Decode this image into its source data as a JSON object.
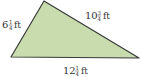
{
  "diagram": {
    "shape": "triangle",
    "fill_color": "#c9dcae",
    "stroke_color": "#3a3a3a",
    "vertices": {
      "top": [
        44,
        1
      ],
      "left": [
        11,
        57
      ],
      "right": [
        139,
        58
      ]
    },
    "labels": {
      "left_side": {
        "whole": "6",
        "num": "1",
        "den": "4",
        "unit": "ft"
      },
      "right_side": {
        "whole": "10",
        "num": "3",
        "den": "4",
        "unit": "ft"
      },
      "bottom_side": {
        "whole": "12",
        "num": "1",
        "den": "4",
        "unit": "ft"
      }
    }
  }
}
